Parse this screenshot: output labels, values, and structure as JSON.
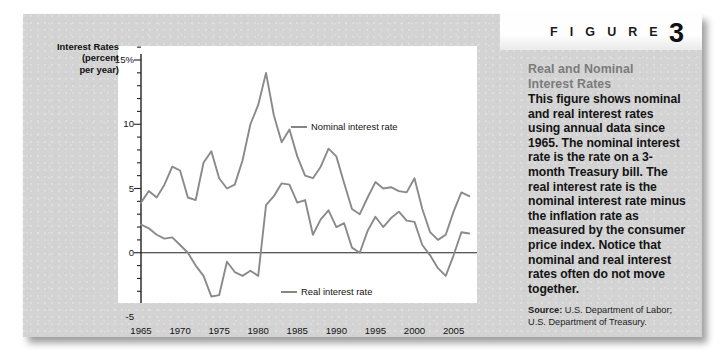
{
  "figure": {
    "word": "F I G U R E",
    "number": "3",
    "title_line1": "Real and Nominal",
    "title_line2": "Interest Rates",
    "body": "This figure shows nominal and real interest rates using annual data since 1965. The nominal interest rate is the rate on a 3-month Treasury bill. The real interest rate is the nominal interest rate minus the inflation rate as measured by the consumer price index. Notice that nominal and real interest rates often do not move together.",
    "source_label": "Source:",
    "source_text": " U.S. Department of Labor; U.S. Department of Treasury."
  },
  "colors": {
    "card_bg": "#d3d3d3",
    "plot_bg": "#ffffff",
    "line": "#8a8a8a",
    "axis": "#222222",
    "heading": "#7b7b7b"
  },
  "chart_data": {
    "type": "line",
    "title": "",
    "xlabel": "",
    "ylabel_lines": [
      "Interest Rates",
      "(percent",
      "per year)"
    ],
    "ylim": [
      -5,
      15
    ],
    "xlim": [
      1965,
      2008
    ],
    "grid": false,
    "zero_line": 0,
    "ytick_labels": [
      "15%",
      "10",
      "5",
      "0",
      "-5"
    ],
    "ytick_values": [
      15,
      10,
      5,
      0,
      -5
    ],
    "yminor_step": 1,
    "xtick_labels": [
      "1965",
      "1970",
      "1975",
      "1980",
      "1985",
      "1990",
      "1995",
      "2000",
      "2005"
    ],
    "xtick_values": [
      1965,
      1970,
      1975,
      1980,
      1985,
      1990,
      1995,
      2000,
      2005
    ],
    "xminor_step": 1,
    "legend": [
      {
        "name": "Nominal interest rate",
        "dash_x": 268,
        "dash_y": 113
      },
      {
        "name": "Real interest rate",
        "dash_x": 258,
        "dash_y": 278
      }
    ],
    "x": [
      1965,
      1966,
      1967,
      1968,
      1969,
      1970,
      1971,
      1972,
      1973,
      1974,
      1975,
      1976,
      1977,
      1978,
      1979,
      1980,
      1981,
      1982,
      1983,
      1984,
      1985,
      1986,
      1987,
      1988,
      1989,
      1990,
      1991,
      1992,
      1993,
      1994,
      1995,
      1996,
      1997,
      1998,
      1999,
      2000,
      2001,
      2002,
      2003,
      2004,
      2005,
      2006,
      2007
    ],
    "series": [
      {
        "name": "Nominal interest rate",
        "values": [
          3.9,
          4.8,
          4.3,
          5.3,
          6.7,
          6.4,
          4.3,
          4.1,
          7.0,
          7.9,
          5.8,
          5.0,
          5.3,
          7.2,
          10.0,
          11.5,
          14.0,
          10.7,
          8.6,
          9.6,
          7.5,
          6.0,
          5.8,
          6.7,
          8.1,
          7.5,
          5.4,
          3.4,
          3.0,
          4.3,
          5.5,
          5.0,
          5.1,
          4.8,
          4.7,
          5.8,
          3.4,
          1.6,
          1.0,
          1.4,
          3.2,
          4.7,
          4.4
        ]
      },
      {
        "name": "Real interest rate",
        "values": [
          2.2,
          1.9,
          1.4,
          1.1,
          1.2,
          0.6,
          0.0,
          -1.0,
          -1.8,
          -3.4,
          -3.3,
          -0.7,
          -1.5,
          -1.8,
          -1.4,
          -1.8,
          3.7,
          4.4,
          5.4,
          5.3,
          3.9,
          4.1,
          1.4,
          2.6,
          3.3,
          2.0,
          2.3,
          0.4,
          0.0,
          1.7,
          2.8,
          2.0,
          2.7,
          3.2,
          2.5,
          2.4,
          0.6,
          -0.2,
          -1.2,
          -1.8,
          -0.2,
          1.6,
          1.5
        ]
      }
    ]
  }
}
